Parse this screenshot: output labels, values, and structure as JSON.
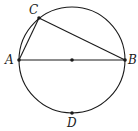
{
  "diagram": {
    "type": "geometry",
    "stroke_color": "#1a1a1a",
    "circle": {
      "cx": 72,
      "cy": 60,
      "r": 53
    },
    "points": {
      "A": {
        "label": "A",
        "x": 19,
        "y": 60
      },
      "B": {
        "label": "B",
        "x": 125,
        "y": 60
      },
      "C": {
        "label": "C",
        "x": 39,
        "y": 18
      },
      "D": {
        "label": "D",
        "x": 72,
        "y": 113
      },
      "O": {
        "x": 72,
        "y": 60
      }
    },
    "segments": [
      [
        "A",
        "B"
      ],
      [
        "A",
        "C"
      ],
      [
        "C",
        "B"
      ]
    ]
  }
}
